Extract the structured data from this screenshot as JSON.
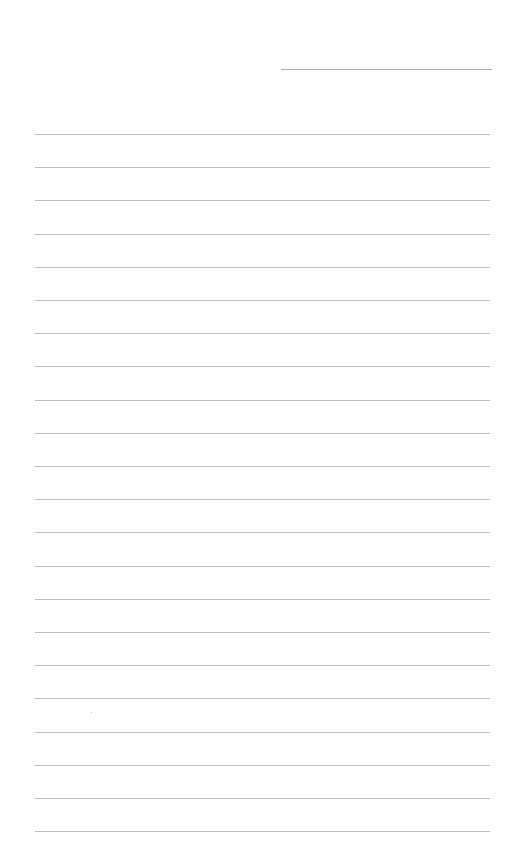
{
  "page": {
    "type": "ruled-notepaper",
    "background_color": "#fefefe",
    "line_color": "#a8a8a8",
    "header_line": {
      "left": 281,
      "top": 69,
      "width": 211
    },
    "rules": {
      "left": 35,
      "width": 455,
      "first_top": 134,
      "spacing": 33.2,
      "count": 22
    }
  }
}
